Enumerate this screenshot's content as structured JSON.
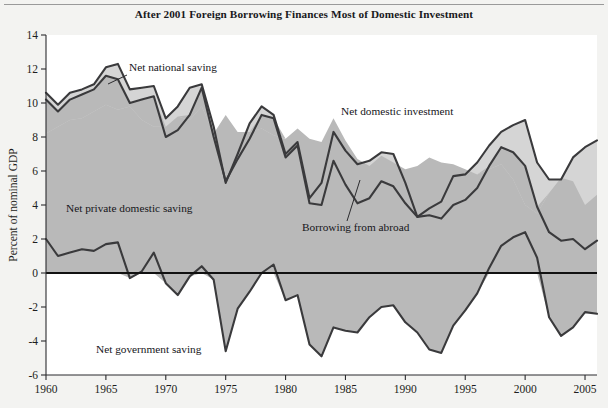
{
  "figure": {
    "title": "After 2001 Foreign Borrowing Finances Most of Domestic Investment",
    "background_color": "#f3f3f1",
    "plot_background_color": "#ffffff",
    "line_color": "#3a3a3c",
    "zero_line_color": "#111111",
    "fill_upper_color": "#d5d5d5",
    "fill_lower_color": "#b9b9b9"
  },
  "annotations": {
    "net_national_saving": "Net national saving",
    "net_domestic_investment": "Net domestic investment",
    "net_private_domestic_saving": "Net private domestic saving",
    "borrowing_from_abroad": "Borrowing from abroad",
    "net_government_saving": "Net government saving"
  },
  "chart_data": {
    "type": "area",
    "title": "After 2001 Foreign Borrowing Finances Most of Domestic Investment",
    "xlabel": "",
    "ylabel": "Percent of nominal GDP",
    "xlim": [
      1960,
      2006
    ],
    "ylim": [
      -6,
      14
    ],
    "xticks": [
      1960,
      1965,
      1970,
      1975,
      1980,
      1985,
      1990,
      1995,
      2000,
      2005
    ],
    "xtick_labels": [
      "1960",
      "1965",
      "1970",
      "1975",
      "1980",
      "1985",
      "1990",
      "1995",
      "2000",
      "2005"
    ],
    "yticks": [
      -6,
      -4,
      -2,
      0,
      2,
      4,
      6,
      8,
      10,
      12,
      14
    ],
    "ytick_labels": [
      "-6",
      "-4",
      "-2",
      "0",
      "2",
      "4",
      "6",
      "8",
      "10",
      "12",
      "14"
    ],
    "grid": false,
    "legend": "annotations-inline",
    "x": [
      1960,
      1961,
      1962,
      1963,
      1964,
      1965,
      1966,
      1967,
      1968,
      1969,
      1970,
      1971,
      1972,
      1973,
      1974,
      1975,
      1976,
      1977,
      1978,
      1979,
      1980,
      1981,
      1982,
      1983,
      1984,
      1985,
      1986,
      1987,
      1988,
      1989,
      1990,
      1991,
      1992,
      1993,
      1994,
      1995,
      1996,
      1997,
      1998,
      1999,
      2000,
      2001,
      2002,
      2003,
      2004,
      2005,
      2006
    ],
    "series": [
      {
        "name": "Net domestic investment",
        "values": [
          10.6,
          9.9,
          10.6,
          10.8,
          11.1,
          12.1,
          12.3,
          10.8,
          10.9,
          11.0,
          9.1,
          9.8,
          10.9,
          11.1,
          8.6,
          5.3,
          7.0,
          8.8,
          9.8,
          9.3,
          7.0,
          7.7,
          4.4,
          5.3,
          8.3,
          7.2,
          6.4,
          6.6,
          7.1,
          7.0,
          5.3,
          3.3,
          3.8,
          4.2,
          5.7,
          5.8,
          6.5,
          7.5,
          8.3,
          8.7,
          9.0,
          6.5,
          5.5,
          5.5,
          6.8,
          7.4,
          7.8
        ]
      },
      {
        "name": "Net national saving",
        "values": [
          10.2,
          9.5,
          10.2,
          10.5,
          10.8,
          11.6,
          11.4,
          10.0,
          10.2,
          10.4,
          8.0,
          8.4,
          9.3,
          10.9,
          8.0,
          5.4,
          6.7,
          7.9,
          9.3,
          9.1,
          6.8,
          7.5,
          4.1,
          4.0,
          6.6,
          5.2,
          4.1,
          4.4,
          5.4,
          5.1,
          4.1,
          3.3,
          3.4,
          3.2,
          4.0,
          4.3,
          5.0,
          6.3,
          7.4,
          7.1,
          6.3,
          3.9,
          2.4,
          1.9,
          2.0,
          1.4,
          1.9
        ]
      },
      {
        "name": "Net private domestic saving",
        "values": [
          8.2,
          8.6,
          9.0,
          9.1,
          9.5,
          9.9,
          9.6,
          9.8,
          9.0,
          8.6,
          8.6,
          9.2,
          9.0,
          9.8,
          8.2,
          9.3,
          8.3,
          8.3,
          8.5,
          8.1,
          7.9,
          8.5,
          7.9,
          7.7,
          9.1,
          7.8,
          6.7,
          6.3,
          6.9,
          6.5,
          6.1,
          6.3,
          6.8,
          6.5,
          6.4,
          6.1,
          5.8,
          6.1,
          6.4,
          5.5,
          4.0,
          3.5,
          4.7,
          5.6,
          5.4,
          4.0,
          4.6
        ]
      },
      {
        "name": "Net government saving",
        "values": [
          2.0,
          1.0,
          1.2,
          1.4,
          1.3,
          1.7,
          1.8,
          -0.3,
          0.1,
          1.2,
          -0.6,
          -1.3,
          -0.2,
          0.4,
          -0.4,
          -4.6,
          -2.1,
          -1.1,
          0.0,
          0.5,
          -1.6,
          -1.3,
          -4.2,
          -4.9,
          -3.2,
          -3.4,
          -3.5,
          -2.6,
          -2.0,
          -1.9,
          -2.9,
          -3.5,
          -4.5,
          -4.7,
          -3.1,
          -2.2,
          -1.2,
          0.3,
          1.6,
          2.1,
          2.4,
          0.9,
          -2.6,
          -3.7,
          -3.2,
          -2.3,
          -2.4
        ]
      }
    ]
  }
}
